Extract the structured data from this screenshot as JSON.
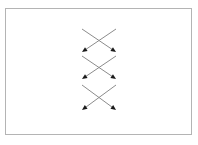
{
  "figure": {
    "background_color": "#ffffff",
    "panel": {
      "border_color": "#b4b4b4",
      "fill_color": "#ffffff",
      "x": 5,
      "y": 8,
      "width": 187,
      "height": 127
    },
    "line_color": "#8c8c8c",
    "arrowhead_color": "#1a1a1a",
    "line_width": 1,
    "units": "px"
  },
  "chart_data": {
    "type": "diagram",
    "xlabel": "",
    "ylabel": "",
    "legend": [],
    "annotations": [],
    "grid": false,
    "xlim": [
      0,
      198
    ],
    "ylim": [
      0,
      145
    ],
    "groups": [
      {
        "name": "crossing-pair-1",
        "left": 82,
        "right": 116,
        "top": 29,
        "bottom": 52,
        "center_x": 99,
        "center_y": 40.5,
        "arrows": [
          {
            "name": "arrow-1-down-right",
            "x1": 82,
            "y1": 29,
            "x2": 116,
            "y2": 52,
            "head": "end",
            "direction": "down-right"
          },
          {
            "name": "arrow-1-down-left",
            "x1": 116,
            "y1": 29,
            "x2": 82,
            "y2": 52,
            "head": "end",
            "direction": "down-left"
          }
        ]
      },
      {
        "name": "crossing-pair-2",
        "left": 82,
        "right": 116,
        "top": 56,
        "bottom": 79,
        "center_x": 99,
        "center_y": 67.5,
        "arrows": [
          {
            "name": "arrow-2-down-right",
            "x1": 82,
            "y1": 56,
            "x2": 116,
            "y2": 79,
            "head": "end",
            "direction": "down-right"
          },
          {
            "name": "arrow-2-down-left",
            "x1": 116,
            "y1": 56,
            "x2": 82,
            "y2": 79,
            "head": "end",
            "direction": "down-left"
          }
        ]
      },
      {
        "name": "crossing-pair-3",
        "left": 82,
        "right": 116,
        "top": 85,
        "bottom": 110,
        "center_x": 99,
        "center_y": 97.5,
        "arrows": [
          {
            "name": "arrow-3-down-right",
            "x1": 82,
            "y1": 85,
            "x2": 116,
            "y2": 110,
            "head": "end",
            "direction": "down-right"
          },
          {
            "name": "arrow-3-down-left",
            "x1": 116,
            "y1": 85,
            "x2": 82,
            "y2": 110,
            "head": "end",
            "direction": "down-left"
          }
        ]
      }
    ]
  }
}
